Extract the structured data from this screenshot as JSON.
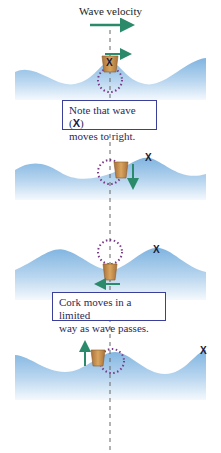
{
  "title": "Wave velocity",
  "colors": {
    "water_top": "#7fb4e0",
    "water_bottom": "#eaf3fb",
    "arrow": "#2a8a6a",
    "circle": "#7a3a8a",
    "cork": "#c8914a",
    "box_border": "#3a3f9a",
    "dashed_line": "#666666"
  },
  "panels": [
    {
      "id": 1,
      "cork_position": "crest",
      "cork_motion": "right",
      "marker": "X on cork"
    },
    {
      "id": 2,
      "cork_position": "descending",
      "cork_motion": "down",
      "marker": "X"
    },
    {
      "id": 3,
      "cork_position": "trough",
      "cork_motion": "left",
      "marker": "X"
    },
    {
      "id": 4,
      "cork_position": "ascending",
      "cork_motion": "up",
      "marker": "X"
    }
  ],
  "marker_label": "X",
  "notes": {
    "note1_prefix": "Note that wave (",
    "note1_marker": "X",
    "note1_suffix": ")",
    "note1_line2": "moves to right.",
    "note2_line1": "Cork moves in a limited",
    "note2_line2": "way as wave passes."
  }
}
